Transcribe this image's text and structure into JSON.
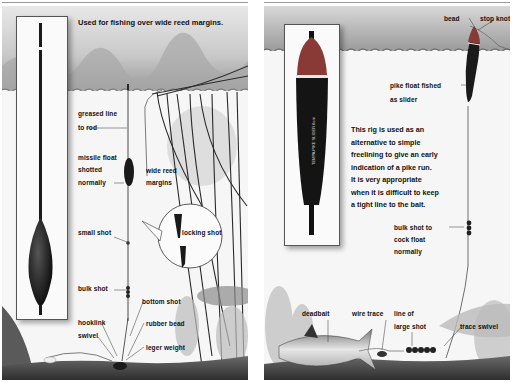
{
  "top_rule": {
    "color": "#999999"
  },
  "panel_left": {
    "caption": "Used for fishing over wide reed margins.",
    "labels": {
      "greased_line_1": "greased line",
      "greased_line_2": "to rod",
      "missile_1": "missile float",
      "missile_2": "shotted",
      "missile_3": "normally",
      "wide_reed_1": "wide reed",
      "wide_reed_2": "margins",
      "small_shot": "small shot",
      "locking_shot": "locking shot",
      "bulk_shot": "bulk shot",
      "bottom_shot": "bottom shot",
      "hooklink": "hooklink",
      "swivel": "swivel",
      "rubber_bead": "rubber bead",
      "leger_weight": "leger weight"
    }
  },
  "panel_right": {
    "float_text": "TEMPA PIKE SLIDER float",
    "paragraph": [
      "This rig is used as an",
      "alternative to simple",
      "freelining to give an early",
      "indication of a pike run.",
      "It is very appropriate",
      "when it is difficult to keep",
      "a tight line to the bait."
    ],
    "labels": {
      "bead": "bead",
      "stop_knot": "stop knot",
      "pike_float_1": "pike float fished",
      "pike_float_2": "as slider",
      "bulk_shot_1": "bulk shot to",
      "bulk_shot_2": "cock float",
      "bulk_shot_3": "normally",
      "deadbait": "deadbait",
      "wire_trace": "wire trace",
      "line_of_1": "line of",
      "line_of_2": "large shot",
      "trace_swivel": "trace swivel"
    }
  },
  "colors": {
    "float_body": "#1a1a1a",
    "float_tip_red": "#8a3a36",
    "float_band": "#e8e8e8",
    "water_surface": "#8a8a8a",
    "bed": "#3f3f3f"
  }
}
